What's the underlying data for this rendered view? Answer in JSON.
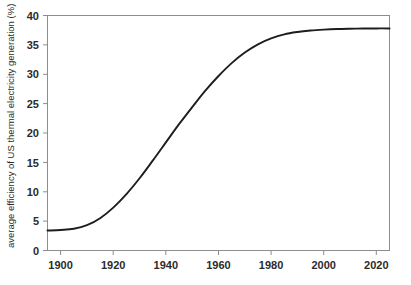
{
  "chart_data": {
    "type": "line",
    "title": "",
    "xlabel": "",
    "ylabel": "average efficiency of US thermal electricity generation (%)",
    "xlim": [
      1890,
      2020
    ],
    "ylim": [
      0,
      40
    ],
    "grid": false,
    "legend": null,
    "xticks": [
      "1900",
      "1920",
      "1940",
      "1960",
      "1980",
      "2000",
      "2020"
    ],
    "xtick_values": [
      1900,
      1920,
      1940,
      1960,
      1980,
      2000,
      2020
    ],
    "yticks": [
      "0",
      "5",
      "10",
      "15",
      "20",
      "25",
      "30",
      "35",
      "40"
    ],
    "ytick_values": [
      0,
      5,
      10,
      15,
      20,
      25,
      30,
      35,
      40
    ],
    "series": [
      {
        "name": "average efficiency of US thermal electricity generation",
        "color": "#1d1d1d",
        "x": [
          1890,
          1895,
          1900,
          1905,
          1910,
          1915,
          1920,
          1925,
          1930,
          1935,
          1940,
          1945,
          1950,
          1955,
          1960,
          1965,
          1970,
          1975,
          1980,
          1985,
          1990,
          1995,
          2000,
          2005,
          2010,
          2015,
          2020
        ],
        "y": [
          3.4,
          3.5,
          3.7,
          4.3,
          5.5,
          7.3,
          9.6,
          12.3,
          15.3,
          18.4,
          21.5,
          24.4,
          27.2,
          29.7,
          31.9,
          33.7,
          35.1,
          36.1,
          36.8,
          37.2,
          37.45,
          37.6,
          37.7,
          37.75,
          37.78,
          37.8,
          37.8
        ]
      }
    ]
  },
  "axes": {
    "y_axis_title": "average efficiency of US thermal electricity generation (%)"
  }
}
